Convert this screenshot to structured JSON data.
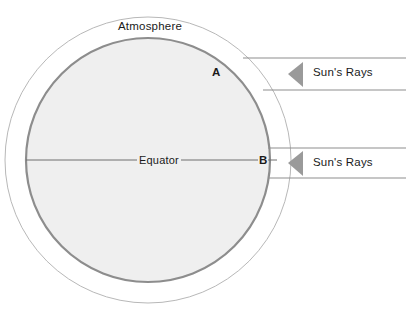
{
  "diagram": {
    "labels": {
      "atmosphere": "Atmosphere",
      "equator": "Equator",
      "point_a": "A",
      "point_b": "B",
      "rays_upper": "Sun's Rays",
      "rays_lower": "Sun's Rays"
    },
    "colors": {
      "background": "#ffffff",
      "earth_fill": "#efefef",
      "earth_stroke": "#8d8d8d",
      "atmosphere_stroke": "#b8b8b8",
      "ray_line": "#8d8d8d",
      "arrow_fill": "#9a9a9a",
      "equator_line": "#6f6f6f",
      "text": "#1a1a1a"
    },
    "geometry": {
      "center_x": 148,
      "center_y": 160,
      "atmosphere_radius": 143,
      "earth_radius": 122,
      "earth_stroke_width": 2.2,
      "atmosphere_stroke_width": 1,
      "equator_y": 160,
      "equator_x_start": 26,
      "equator_x_end": 277,
      "ray_upper_y1": 58,
      "ray_upper_y2": 90,
      "ray_lower_y1": 148,
      "ray_lower_y2": 178,
      "ray_x_end": 406,
      "arrow_upper_tip_x": 288,
      "arrow_upper_center_y": 74,
      "arrow_lower_tip_x": 288,
      "arrow_lower_center_y": 163,
      "arrow_width": 15,
      "arrow_height": 26
    }
  }
}
